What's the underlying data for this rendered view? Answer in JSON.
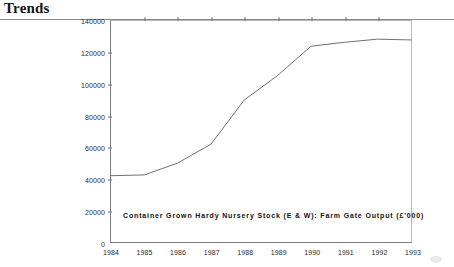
{
  "header": {
    "title": "Trends"
  },
  "chart_data": {
    "type": "line",
    "title": "",
    "caption": "Container Grown Hardy Nursery Stock (E & W): Farm Gate Output (£'000)",
    "xlabel": "",
    "ylabel": "",
    "grid": false,
    "legend": "none",
    "x": [
      1984,
      1985,
      1986,
      1987,
      1988,
      1989,
      1990,
      1991,
      1992,
      1993
    ],
    "categories": [
      "1984",
      "1985",
      "1986",
      "1987",
      "1988",
      "1989",
      "1990",
      "1991",
      "1992",
      "1993"
    ],
    "values": [
      42000,
      42500,
      50000,
      62000,
      90000,
      105500,
      124000,
      126500,
      128500,
      128000
    ],
    "series": [
      {
        "name": "Farm Gate Output",
        "values": [
          42000,
          42500,
          50000,
          62000,
          90000,
          105500,
          124000,
          126500,
          128500,
          128000
        ]
      }
    ],
    "xlim": [
      1984,
      1993
    ],
    "ylim": [
      0,
      140000
    ],
    "yticks": [
      0,
      20000,
      40000,
      60000,
      80000,
      100000,
      120000,
      140000
    ],
    "ytick_labels": [
      "0",
      "20000",
      "40000",
      "60000",
      "80000",
      "100000",
      "120000",
      "140000"
    ],
    "xticks": [
      1984,
      1985,
      1986,
      1987,
      1988,
      1989,
      1990,
      1991,
      1992,
      1993
    ],
    "xtick_labels": [
      "1984",
      "1985",
      "1986",
      "1987",
      "1988",
      "1989",
      "1990",
      "1991",
      "1992",
      "1993"
    ],
    "line_color": "#6e6e6e"
  }
}
